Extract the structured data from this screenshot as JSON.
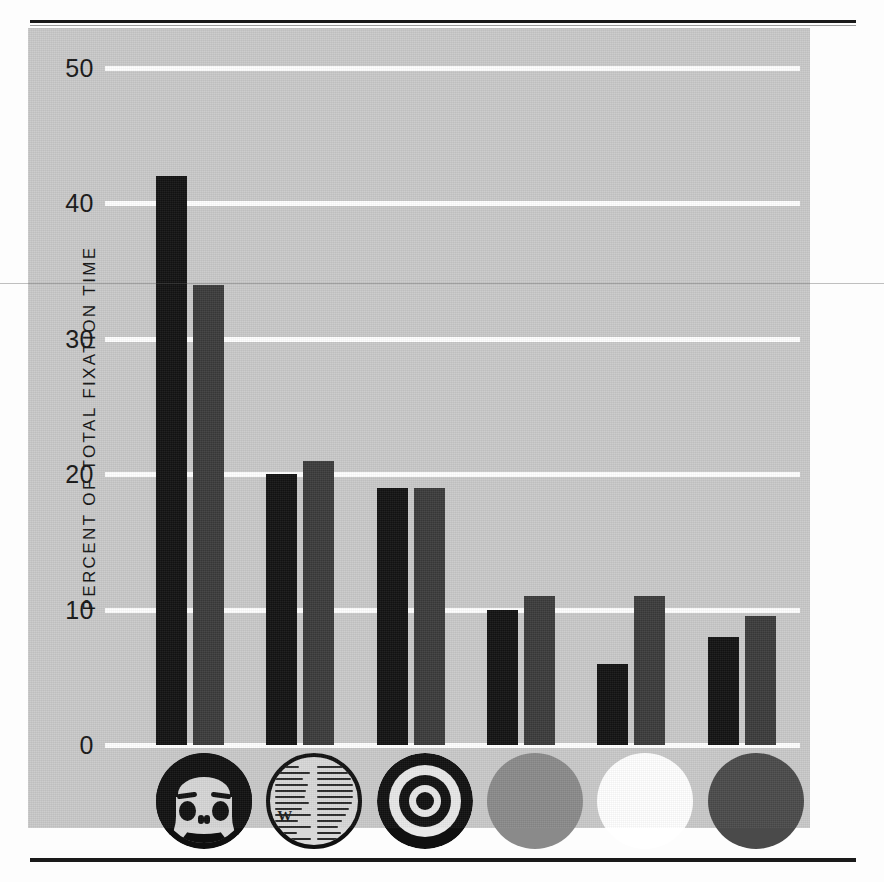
{
  "figure": {
    "plate_background": "#c9c9c9",
    "page_background": "#fdfdfd"
  },
  "axis": {
    "y_title": "PERCENT OF TOTAL FIXATION TIME",
    "y_ticks": [
      "0",
      "10",
      "20",
      "30",
      "40",
      "50"
    ]
  },
  "legend": {
    "series": [
      {
        "name": "series-1",
        "color": "#121212"
      },
      {
        "name": "series-2",
        "color": "#3b3b3b"
      }
    ]
  },
  "stimuli": [
    {
      "id": "face",
      "icon": "face-icon",
      "label": "face",
      "color": "#101010"
    },
    {
      "id": "newsprint",
      "icon": "newsprint-icon",
      "label": "newsprint",
      "color": "#101010"
    },
    {
      "id": "bullseye",
      "icon": "bullseye-icon",
      "label": "bullseye",
      "color": "#101010"
    },
    {
      "id": "gray",
      "icon": "gray-disk-icon",
      "label": "gray disk",
      "color": "#8a8a8a"
    },
    {
      "id": "white",
      "icon": "white-disk-icon",
      "label": "white disk",
      "color": "#ffffff"
    },
    {
      "id": "red",
      "icon": "red-disk-icon",
      "label": "red disk",
      "color": "#4a4a4a"
    }
  ],
  "chart_data": {
    "type": "bar",
    "title": "",
    "xlabel": "",
    "ylabel": "PERCENT OF TOTAL FIXATION TIME",
    "ylim": [
      0,
      50
    ],
    "yticks": [
      0,
      10,
      20,
      30,
      40,
      50
    ],
    "grid": true,
    "legend_position": "none",
    "categories": [
      "face",
      "newsprint",
      "bullseye",
      "gray disk",
      "white disk",
      "red disk"
    ],
    "series": [
      {
        "name": "series-1",
        "color": "#121212",
        "values": [
          42,
          20,
          19,
          10,
          6,
          8
        ]
      },
      {
        "name": "series-2",
        "color": "#3b3b3b",
        "values": [
          34,
          21,
          19,
          11,
          11,
          9.5
        ]
      }
    ]
  }
}
